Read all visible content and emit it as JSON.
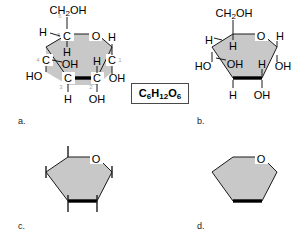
{
  "figure": {
    "background_color": "#ffffff",
    "ring_fill_color": "#c8c8c8",
    "ring_stroke_color": "#1a1a1a",
    "bold_bond_color": "#000000",
    "carbon_number_color": "#a8a8a8"
  },
  "formula": {
    "label": "C6H12O6",
    "element_c": "C",
    "sub_6a": "6",
    "element_h": "H",
    "sub_12": "12",
    "element_o": "O",
    "sub_6b": "6"
  },
  "panels": [
    {
      "id": "a",
      "label": "a.",
      "description": "Full Haworth projection with carbon atom labels and numbering",
      "ring_oxygen": "O",
      "carbon_numbers": [
        "1",
        "2",
        "3",
        "4",
        "5",
        "6"
      ],
      "carbon_labels": [
        "C",
        "C",
        "C",
        "C",
        "C"
      ],
      "top_group": "CH2OH",
      "top_group_element_c": "C",
      "top_group_element_h": "H",
      "top_group_sub": "2",
      "top_group_oh": "OH",
      "substituents": {
        "c5_h_left": "H",
        "c5_h_inner": "H",
        "c4_oh_inner": "OH",
        "c4_ho_left": "HO",
        "c3_h_down": "H",
        "c2_h_inner": "H",
        "c2_oh_down": "OH",
        "c1_h_up": "H",
        "c1_oh_right": "OH"
      }
    },
    {
      "id": "b",
      "label": "b.",
      "description": "Haworth projection without explicit carbon labels",
      "ring_oxygen": "O",
      "top_group": "CH2OH",
      "top_group_element_c": "C",
      "top_group_element_h": "H",
      "top_group_sub": "2",
      "top_group_oh": "OH",
      "substituents": {
        "c5_h_left": "H",
        "c5_h_inner": "H",
        "c4_oh_inner": "OH",
        "c4_ho_left": "HO",
        "c3_h_down": "H",
        "c2_h_inner": "H",
        "c2_oh_down": "OH",
        "c1_h_up": "H",
        "c1_oh_right": "OH"
      }
    },
    {
      "id": "c",
      "label": "c.",
      "description": "Simplified ring with bond stubs only",
      "ring_oxygen": "O"
    },
    {
      "id": "d",
      "label": "d.",
      "description": "Bare ring skeleton with oxygen only",
      "ring_oxygen": "O"
    }
  ]
}
